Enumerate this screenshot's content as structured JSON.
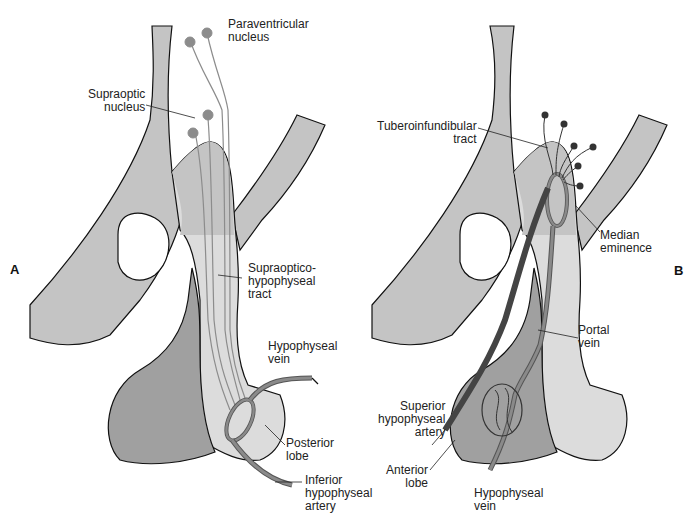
{
  "figure": {
    "panels": [
      {
        "id": "A",
        "label": "A",
        "annotations": {
          "paraventricular": "Paraventricular\nnucleus",
          "supraoptic": "Supraoptic\nnucleus",
          "tract": "Supraoptico-\nhypophyseal\ntract",
          "vein": "Hypophyseal\nvein",
          "posterior": "Posterior\nlobe",
          "artery": "Inferior\nhypophyseal\nartery"
        }
      },
      {
        "id": "B",
        "label": "B",
        "annotations": {
          "tuberoinfundibular": "Tuberoinfundibular\ntract",
          "median": "Median\neminence",
          "portal": "Portal\nvein",
          "superior": "Superior\nhypophyseal\nartery",
          "anterior": "Anterior\nlobe",
          "vein": "Hypophyseal\nvein"
        }
      }
    ],
    "colors": {
      "tissue_light": "#c4c4c4",
      "tissue_pale": "#dcdcdc",
      "anterior_lobe": "#a0a0a0",
      "vessel": "#8a8a8a",
      "artery_dark": "#555555",
      "neuron": "#8c8c8c",
      "outline": "#111111"
    }
  }
}
